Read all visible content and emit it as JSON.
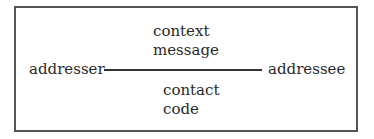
{
  "diagram": {
    "type": "communication-model",
    "left_node": "addresser",
    "right_node": "addressee",
    "above_line": [
      "context",
      "message"
    ],
    "below_line": [
      "contact",
      "code"
    ],
    "colors": {
      "border": "#555555",
      "text": "#2a2a2a",
      "background": "#ffffff"
    }
  }
}
